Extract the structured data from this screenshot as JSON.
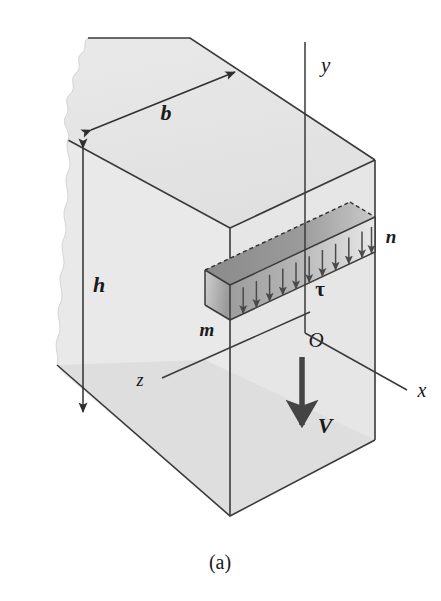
{
  "figure": {
    "caption": "(a)",
    "description_labels": {
      "width_dimension": "b",
      "height_dimension": "h",
      "axis_vertical": "y",
      "axis_depth_right": "x",
      "axis_depth_left": "z",
      "origin": "O",
      "shear_force": "V",
      "shear_stress": "τ",
      "element_left_end": "m",
      "element_right_end": "n"
    },
    "colors": {
      "block_face_light": "#e7e7e7",
      "block_face_top": "#e3e3e3",
      "block_face_bottom": "#dcdcdc",
      "element_top_dark": "#8f8f8f",
      "element_front_mid": "#b9b9b9",
      "outline": "#3a3a3a",
      "arrow": "#4a4a4a",
      "text": "#1a1a1a"
    },
    "geometry": {
      "shear_arrow_count": 11,
      "hidden_edge_style": "dashed"
    }
  }
}
